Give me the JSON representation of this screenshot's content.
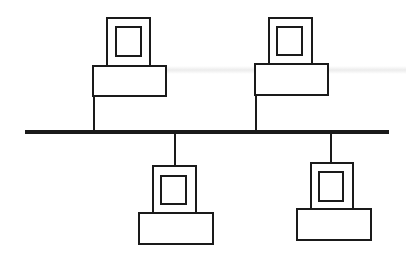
{
  "diagram": {
    "type": "bus-topology",
    "stroke_color": "#1a1a1a",
    "background_color": "#ffffff",
    "bus": {
      "label": "Network bus",
      "x1": 25,
      "y": 132,
      "x2": 389,
      "thickness": 4
    },
    "nodes": [
      {
        "label": "Computer 1",
        "position": "top",
        "drop_x": 94,
        "monitor": {
          "x": 107,
          "y": 18,
          "w": 43,
          "h": 48
        },
        "screen": {
          "x": 116,
          "y": 27,
          "w": 25,
          "h": 29
        },
        "base": {
          "x": 93,
          "y": 66,
          "w": 73,
          "h": 30
        }
      },
      {
        "label": "Computer 2",
        "position": "top",
        "drop_x": 256,
        "monitor": {
          "x": 269,
          "y": 18,
          "w": 43,
          "h": 46
        },
        "screen": {
          "x": 277,
          "y": 27,
          "w": 25,
          "h": 28
        },
        "base": {
          "x": 255,
          "y": 64,
          "w": 73,
          "h": 31
        }
      },
      {
        "label": "Computer 3",
        "position": "bottom",
        "drop_x": 175,
        "monitor": {
          "x": 153,
          "y": 166,
          "w": 43,
          "h": 47
        },
        "screen": {
          "x": 161,
          "y": 176,
          "w": 25,
          "h": 28
        },
        "base": {
          "x": 139,
          "y": 213,
          "w": 74,
          "h": 31
        }
      },
      {
        "label": "Computer 4",
        "position": "bottom",
        "drop_x": 331,
        "monitor": {
          "x": 311,
          "y": 163,
          "w": 42,
          "h": 46
        },
        "screen": {
          "x": 319,
          "y": 172,
          "w": 24,
          "h": 29
        },
        "base": {
          "x": 297,
          "y": 209,
          "w": 74,
          "h": 31
        }
      }
    ]
  }
}
